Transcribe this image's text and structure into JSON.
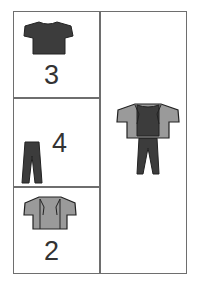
{
  "cells": [
    {
      "item": "t-shirt-icon",
      "count": "3"
    },
    {
      "item": "pants-icon",
      "count": "4"
    },
    {
      "item": "jacket-icon",
      "count": "2"
    }
  ],
  "outfit": {
    "item": "full-outfit-icon"
  },
  "colors": {
    "dark": "#3c3c3c",
    "light": "#9a9a9a",
    "border": "#6e6e6e"
  }
}
